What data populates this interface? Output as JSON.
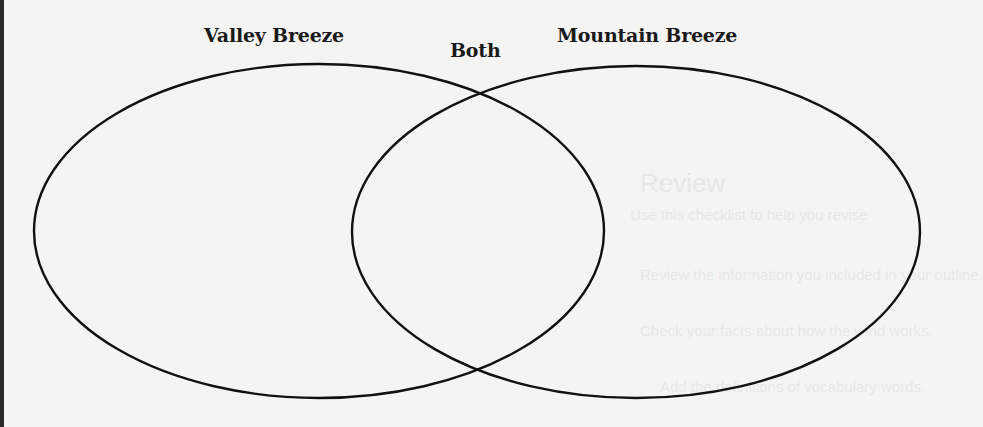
{
  "diagram": {
    "type": "venn",
    "sets": [
      {
        "label": "Valley Breeze",
        "position": "left"
      },
      {
        "label": "Mountain Breeze",
        "position": "right"
      }
    ],
    "intersection_label": "Both",
    "colors": {
      "stroke": "#111111",
      "background": "#f4f4f2",
      "text": "#1a1a1a"
    }
  },
  "bleed_through": {
    "heading": "Review",
    "lines": [
      "Use this checklist to help you revise",
      "Review the information you included in your outline.",
      "Check your facts about how the wind works.",
      "Add the definitions of vocabulary words."
    ]
  }
}
